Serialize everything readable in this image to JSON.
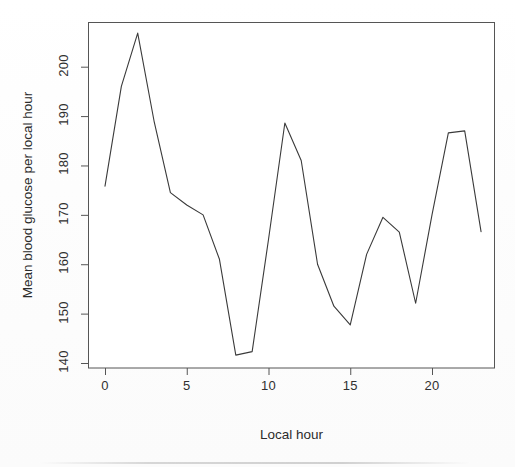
{
  "chart_data": {
    "type": "line",
    "title": "",
    "xlabel": "Local hour",
    "ylabel": "Mean blood glucose per local hour",
    "x": [
      0,
      1,
      2,
      3,
      4,
      5,
      6,
      7,
      8,
      9,
      10,
      11,
      12,
      13,
      14,
      15,
      16,
      17,
      18,
      19,
      20,
      21,
      22,
      23
    ],
    "values": [
      175.8,
      196.0,
      206.8,
      189.0,
      174.5,
      172.0,
      170.0,
      161.0,
      141.6,
      142.3,
      165.0,
      188.6,
      181.0,
      160.0,
      151.5,
      147.7,
      162.0,
      169.5,
      166.5,
      152.1,
      170.0,
      186.6,
      187.0,
      166.6
    ],
    "series": [
      {
        "name": "Mean blood glucose per local hour",
        "values": [
          175.8,
          196.0,
          206.8,
          189.0,
          174.5,
          172.0,
          170.0,
          161.0,
          141.6,
          142.3,
          165.0,
          188.6,
          181.0,
          160.0,
          151.5,
          147.7,
          162.0,
          169.5,
          166.5,
          152.1,
          170.0,
          186.6,
          187.0,
          166.6
        ]
      }
    ],
    "xlim": [
      -0.5,
      23.5
    ],
    "ylim": [
      140,
      210
    ],
    "xticks": [
      0,
      5,
      10,
      15,
      20
    ],
    "xtick_labels": [
      "0",
      "5",
      "10",
      "15",
      "20"
    ],
    "yticks": [
      140,
      150,
      160,
      170,
      180,
      190,
      200
    ],
    "ytick_labels": [
      "140",
      "150",
      "160",
      "170",
      "180",
      "190",
      "200"
    ],
    "grid": false,
    "legend": false,
    "legend_position": "none",
    "line_color": "#3a3a3a",
    "line_width": 1,
    "frame": true,
    "frame_color": "#555555",
    "background": "#ffffff",
    "annotations": []
  },
  "axes": {
    "x_label": "Local hour",
    "y_label": "Mean blood glucose per local hour",
    "x_tick_labels": [
      "0",
      "5",
      "10",
      "15",
      "20"
    ],
    "y_tick_labels": [
      "140",
      "150",
      "160",
      "170",
      "180",
      "190",
      "200"
    ]
  },
  "style": {
    "text_color": "#2b2b2b",
    "line_color": "#3a3a3a",
    "frame_color": "#555555",
    "tick_color": "#555555",
    "plot_background": "#ffffff"
  }
}
